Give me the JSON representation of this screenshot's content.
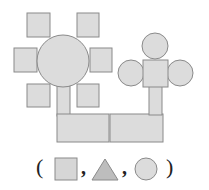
{
  "figure": {
    "colors": {
      "fill": "#dcdcdc",
      "stroke": "#8a8a8a",
      "triangle_fill": "#bdbdbd"
    }
  },
  "legend": {
    "open_paren": "(",
    "close_paren": ")",
    "separator_1": ",",
    "separator_2": ",",
    "shapes": [
      "square",
      "triangle",
      "circle"
    ]
  }
}
